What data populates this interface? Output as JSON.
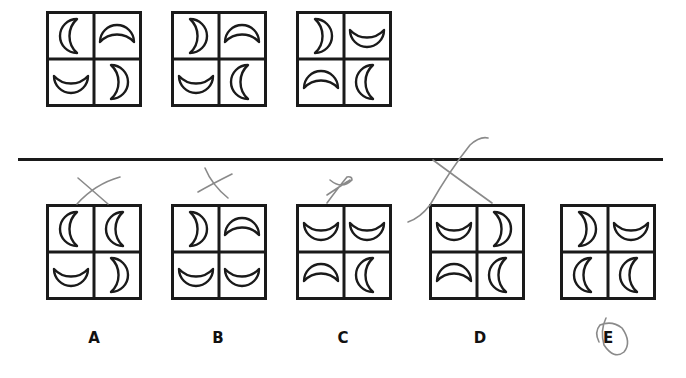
{
  "question": {
    "sequence": [
      {
        "cells": [
          "open-right",
          "open-down",
          "open-up",
          "open-left"
        ]
      },
      {
        "cells": [
          "open-left",
          "open-down",
          "open-up",
          "open-right"
        ]
      },
      {
        "cells": [
          "open-left",
          "open-up",
          "open-down",
          "open-right"
        ]
      }
    ]
  },
  "options": [
    {
      "label": "A",
      "cells": [
        "open-right",
        "open-right",
        "open-up",
        "open-left"
      ],
      "mark": "crossed-out"
    },
    {
      "label": "B",
      "cells": [
        "open-left",
        "open-down",
        "open-up",
        "open-up"
      ],
      "mark": "crossed-out"
    },
    {
      "label": "C",
      "cells": [
        "open-up",
        "open-up",
        "open-down",
        "open-right"
      ],
      "mark": "crossed-out"
    },
    {
      "label": "D",
      "cells": [
        "open-up",
        "open-left",
        "open-down",
        "open-right"
      ],
      "mark": "crossed-out"
    },
    {
      "label": "E",
      "cells": [
        "open-left",
        "open-up",
        "open-right",
        "open-right"
      ],
      "mark": "circled"
    }
  ],
  "colors": {
    "ink": "#1a1a1a",
    "pencil": "#8a8a8a"
  }
}
